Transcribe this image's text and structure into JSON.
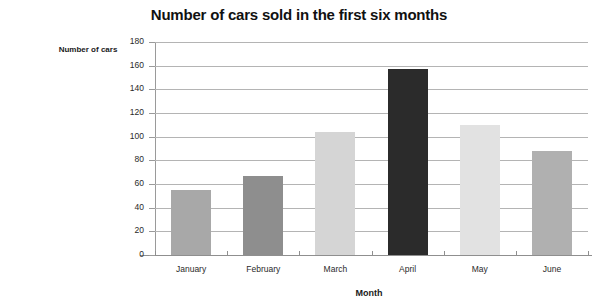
{
  "chart_data": {
    "type": "bar",
    "title": "Number of cars sold in the first six months",
    "xlabel": "Month",
    "ylabel": "Number of cars",
    "categories": [
      "January",
      "February",
      "March",
      "April",
      "May",
      "June"
    ],
    "values": [
      55,
      67,
      104,
      157,
      110,
      88
    ],
    "bar_colors": [
      "#a8a8a8",
      "#8e8e8e",
      "#d5d5d5",
      "#2b2b2b",
      "#e2e2e2",
      "#b0b0b0"
    ],
    "ylim": [
      0,
      180
    ],
    "ytick_values": [
      0,
      20,
      40,
      60,
      80,
      100,
      120,
      140,
      160,
      180
    ],
    "ytick_labels": [
      "0",
      "20",
      "40",
      "60",
      "80",
      "100",
      "120",
      "140",
      "160",
      "180"
    ],
    "grid": true,
    "legend": false,
    "legend_position": "none",
    "axis_color": "#9a9a9a",
    "gridline_color": "#b4b4b4"
  }
}
